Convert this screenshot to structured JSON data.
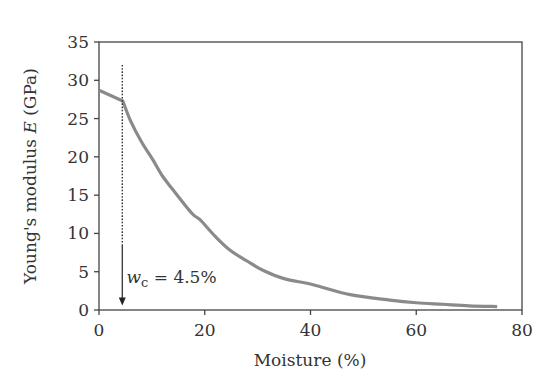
{
  "chart_data": {
    "type": "line",
    "title": "",
    "xlabel": "Moisture (%)",
    "ylabel_prefix": "Young's modulus ",
    "ylabel_symbol": "E",
    "ylabel_suffix": " (GPa)",
    "xlim": [
      0,
      80
    ],
    "ylim": [
      0,
      35
    ],
    "xticks": [
      0,
      20,
      40,
      60,
      80
    ],
    "yticks": [
      0,
      5,
      10,
      15,
      20,
      25,
      30,
      35
    ],
    "grid": false,
    "legend": null,
    "series": [
      {
        "name": "Young's modulus E",
        "color": "#8a8a8a",
        "x": [
          0,
          4.5,
          5.9,
          8,
          10.2,
          12,
          14,
          17.6,
          19.1,
          22,
          24.8,
          28,
          31,
          35,
          40.5,
          47.5,
          55,
          60,
          65,
          70,
          75.3
        ],
        "y": [
          28.7,
          27.3,
          24.8,
          22.0,
          19.6,
          17.5,
          15.7,
          12.6,
          11.8,
          9.6,
          7.8,
          6.4,
          5.2,
          4.1,
          3.3,
          2.0,
          1.3,
          0.95,
          0.75,
          0.55,
          0.45
        ]
      }
    ],
    "annotations": [
      {
        "type": "vertical-arrow",
        "x": 4.5,
        "y_top": 32,
        "y_bottom": 0.6,
        "dotted_until_y": 8.5,
        "label_symbol": "w",
        "label_subscript": "c",
        "label_value": " = 4.5%",
        "label_x": 5.2,
        "label_y": 4.3
      }
    ]
  }
}
